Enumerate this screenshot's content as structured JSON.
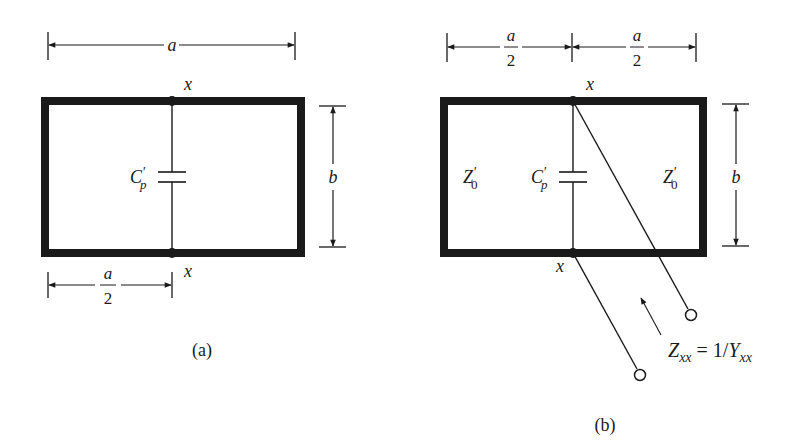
{
  "figure": {
    "panels": [
      {
        "id": "a",
        "caption": "(a)",
        "width_label": "a",
        "height_label": "b",
        "half_width_label_num": "a",
        "half_width_label_den": "2",
        "node_top_label": "x",
        "node_bottom_label": "x",
        "capacitor_label_main": "C",
        "capacitor_label_prime": "′",
        "capacitor_label_sub": "p"
      },
      {
        "id": "b",
        "caption": "(b)",
        "half_width_left_num": "a",
        "half_width_left_den": "2",
        "half_width_right_num": "a",
        "half_width_right_den": "2",
        "height_label": "b",
        "node_top_label": "x",
        "node_bottom_label": "x",
        "capacitor_label_main": "C",
        "capacitor_label_prime": "′",
        "capacitor_label_sub": "p",
        "left_impedance_main": "Z",
        "left_impedance_prime": "′",
        "left_impedance_sub": "0",
        "right_impedance_main": "Z",
        "right_impedance_prime": "′",
        "right_impedance_sub": "0",
        "port_impedance": {
          "lhs_main": "Z",
          "lhs_sub": "xx",
          "equals": "=",
          "rhs_prefix": "1/",
          "rhs_main": "Y",
          "rhs_sub": "xx"
        }
      }
    ],
    "colors": {
      "ink": "#1a1a1a",
      "background": "#ffffff"
    }
  }
}
